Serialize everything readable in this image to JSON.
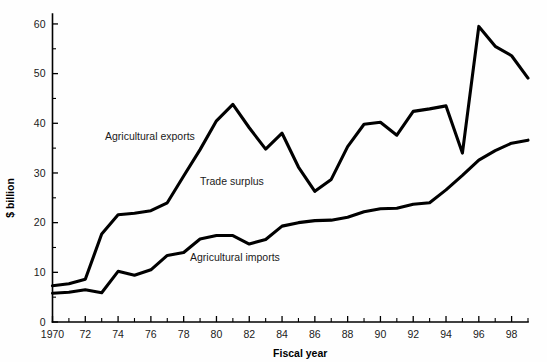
{
  "chart_data": {
    "type": "line",
    "title": "",
    "xlabel": "Fiscal year",
    "ylabel": "$ billion",
    "xlim": [
      1970,
      1999
    ],
    "ylim": [
      0,
      62
    ],
    "grid": false,
    "legend_position": "inline-annotations",
    "x": [
      1970,
      1971,
      1972,
      1973,
      1974,
      1975,
      1976,
      1977,
      1978,
      1979,
      1980,
      1981,
      1982,
      1983,
      1984,
      1985,
      1986,
      1987,
      1988,
      1989,
      1990,
      1991,
      1992,
      1993,
      1994,
      1995,
      1996,
      1997,
      1998,
      1999
    ],
    "x_tick_labels": [
      "1970",
      "72",
      "74",
      "76",
      "78",
      "80",
      "82",
      "84",
      "86",
      "88",
      "90",
      "92",
      "94",
      "96",
      "98"
    ],
    "y_tick_labels": [
      "0",
      "10",
      "20",
      "30",
      "40",
      "50",
      "60"
    ],
    "y_major_ticks": [
      0,
      10,
      20,
      30,
      40,
      50,
      60
    ],
    "y_minor_ticks": [
      5,
      15,
      25,
      35,
      45,
      55
    ],
    "series": [
      {
        "name": "Agricultural exports",
        "label_text": "Agricultural exports",
        "values": [
          7.3,
          7.7,
          8.6,
          17.7,
          21.6,
          21.9,
          22.4,
          24.0,
          29.4,
          34.7,
          40.5,
          43.8,
          39.1,
          34.8,
          38.0,
          31.2,
          26.3,
          28.7,
          35.3,
          39.8,
          40.2,
          37.6,
          42.4,
          42.9,
          43.5,
          34.0,
          59.5,
          55.5,
          53.6,
          49.1
        ]
      },
      {
        "name": "Agricultural imports",
        "label_text": "Agricultural imports",
        "values": [
          5.8,
          6.0,
          6.5,
          5.9,
          10.2,
          9.4,
          10.5,
          13.4,
          14.0,
          16.7,
          17.4,
          17.4,
          15.7,
          16.6,
          19.3,
          20.0,
          20.4,
          20.5,
          21.1,
          22.2,
          22.8,
          22.9,
          23.7,
          24.0,
          26.6,
          29.5,
          32.6,
          34.5,
          36.0,
          36.6
        ]
      }
    ],
    "annotations": [
      {
        "text": "Agricultural exports",
        "x_px": 105,
        "y_px": 140
      },
      {
        "text": "Trade surplus",
        "x_px": 200,
        "y_px": 185
      },
      {
        "text": "Agricultural imports",
        "x_px": 190,
        "y_px": 261
      }
    ]
  }
}
